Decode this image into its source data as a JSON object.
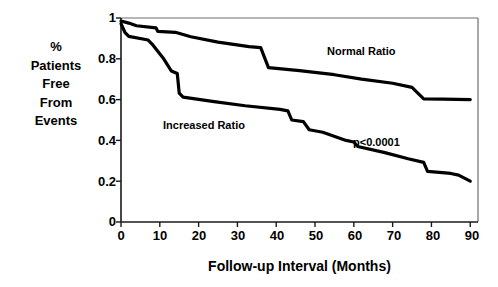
{
  "chart_data": {
    "type": "line",
    "title": "",
    "xlabel": "Follow-up Interval (Months)",
    "ylabel": "% Patients Free From Events",
    "ylabel_lines": [
      "%",
      "Patients",
      "Free",
      "From",
      "Events"
    ],
    "xlim": [
      0,
      92
    ],
    "ylim": [
      0,
      1
    ],
    "xticks": [
      0,
      10,
      20,
      30,
      40,
      50,
      60,
      70,
      80,
      90
    ],
    "xtick_labels": [
      "0",
      "10",
      "20",
      "30",
      "40",
      "50",
      "60",
      "70",
      "80",
      "90"
    ],
    "yticks": [
      0,
      0.2,
      0.4,
      0.6,
      0.8,
      1
    ],
    "ytick_labels": [
      "0",
      "0.2",
      "0.4",
      "0.6",
      "0.8",
      "1"
    ],
    "grid": false,
    "legend_position": "inline-annotation",
    "annotations": [
      {
        "name": "p-value",
        "text": "p<0.0001",
        "x": 62,
        "y": 0.4
      },
      {
        "name": "normal-ratio-label",
        "text": "Normal Ratio",
        "x": 58,
        "y": 0.84
      },
      {
        "name": "increased-ratio-label",
        "text": "Increased Ratio",
        "x": 20,
        "y": 0.5
      }
    ],
    "series": [
      {
        "name": "Normal Ratio",
        "color": "#000000",
        "points": [
          [
            0,
            0.985
          ],
          [
            2,
            0.975
          ],
          [
            4,
            0.962
          ],
          [
            9,
            0.952
          ],
          [
            9.5,
            0.934
          ],
          [
            14,
            0.93
          ],
          [
            18,
            0.908
          ],
          [
            25,
            0.882
          ],
          [
            33,
            0.86
          ],
          [
            36,
            0.855
          ],
          [
            38,
            0.757
          ],
          [
            46,
            0.742
          ],
          [
            55,
            0.722
          ],
          [
            62,
            0.7
          ],
          [
            70,
            0.68
          ],
          [
            75,
            0.66
          ],
          [
            78,
            0.604
          ],
          [
            83,
            0.602
          ],
          [
            90,
            0.6
          ]
        ]
      },
      {
        "name": "Increased Ratio",
        "color": "#000000",
        "points": [
          [
            0,
            0.972
          ],
          [
            1,
            0.93
          ],
          [
            2,
            0.91
          ],
          [
            7,
            0.892
          ],
          [
            8,
            0.872
          ],
          [
            11,
            0.8
          ],
          [
            13,
            0.74
          ],
          [
            14.5,
            0.728
          ],
          [
            15,
            0.632
          ],
          [
            16,
            0.612
          ],
          [
            24,
            0.59
          ],
          [
            32,
            0.57
          ],
          [
            41,
            0.552
          ],
          [
            43,
            0.545
          ],
          [
            44,
            0.5
          ],
          [
            47,
            0.492
          ],
          [
            48.5,
            0.452
          ],
          [
            52,
            0.44
          ],
          [
            58,
            0.4
          ],
          [
            60,
            0.392
          ],
          [
            61,
            0.37
          ],
          [
            68,
            0.34
          ],
          [
            74,
            0.31
          ],
          [
            78,
            0.292
          ],
          [
            79,
            0.248
          ],
          [
            85,
            0.238
          ],
          [
            87,
            0.23
          ],
          [
            90,
            0.2
          ]
        ]
      }
    ]
  },
  "frame": {
    "top_border": true,
    "right_border": true,
    "left_axis": true,
    "bottom_axis": true
  }
}
